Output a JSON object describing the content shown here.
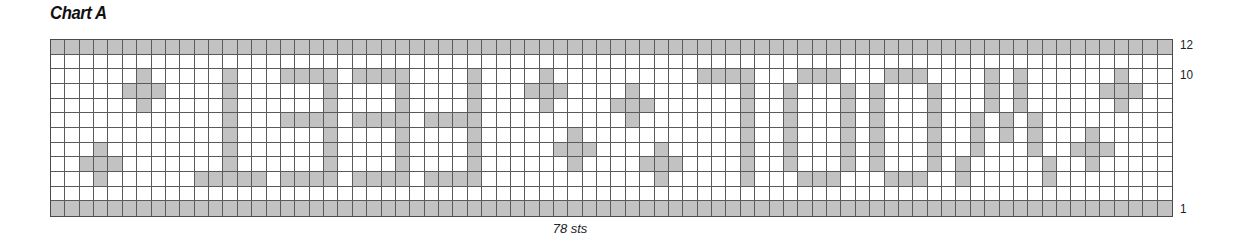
{
  "title": "Chart A",
  "stitch_count_label": "78 sts",
  "row_labels": [
    {
      "text": "12",
      "row_from_top": 0
    },
    {
      "text": "10",
      "row_from_top": 2
    },
    {
      "text": "1",
      "row_from_top": 11
    }
  ],
  "colors": {
    "filled": "#c2c2c2",
    "empty": "#ffffff",
    "grid_line": "#5a5a5a"
  },
  "chart_data": {
    "type": "heatmap",
    "title": "Chart A",
    "xlabel": "78 sts",
    "columns": 78,
    "rows": 12,
    "row_numbering": "bottom-to-top, 1 to 12",
    "row_tick_labels": [
      "12",
      "10",
      "1"
    ],
    "filled_cells_by_row_from_top": [
      "all",
      [],
      [
        6,
        12,
        16,
        17,
        18,
        19,
        21,
        22,
        23,
        24,
        29,
        34,
        45,
        46,
        47,
        48,
        52,
        53,
        54,
        58,
        59,
        60,
        65,
        67,
        74
      ],
      [
        5,
        6,
        7,
        12,
        19,
        24,
        29,
        33,
        34,
        35,
        40,
        48,
        51,
        55,
        57,
        61,
        65,
        67,
        73,
        74,
        75
      ],
      [
        6,
        12,
        19,
        24,
        29,
        34,
        39,
        40,
        41,
        48,
        51,
        55,
        57,
        61,
        65,
        67,
        74
      ],
      [
        12,
        16,
        17,
        18,
        19,
        21,
        22,
        23,
        24,
        26,
        27,
        28,
        29,
        40,
        48,
        51,
        55,
        57,
        61,
        64,
        66,
        68
      ],
      [
        12,
        19,
        24,
        29,
        36,
        48,
        51,
        55,
        57,
        61,
        64,
        66,
        68,
        72
      ],
      [
        3,
        12,
        19,
        24,
        29,
        35,
        36,
        37,
        42,
        48,
        51,
        55,
        57,
        61,
        64,
        68,
        71,
        72,
        73
      ],
      [
        2,
        3,
        4,
        12,
        19,
        24,
        29,
        36,
        41,
        42,
        43,
        48,
        51,
        55,
        57,
        61,
        63,
        69,
        72
      ],
      [
        3,
        10,
        11,
        12,
        13,
        14,
        16,
        17,
        18,
        19,
        21,
        22,
        23,
        24,
        26,
        27,
        28,
        29,
        42,
        48,
        52,
        53,
        54,
        58,
        59,
        60,
        63,
        69
      ],
      [],
      "all"
    ]
  }
}
